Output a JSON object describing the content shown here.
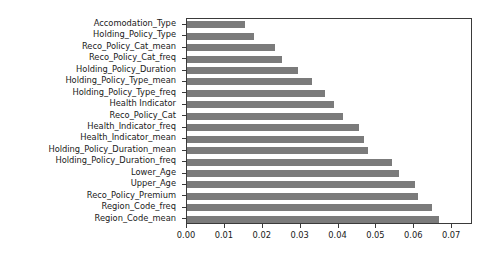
{
  "chart_data": {
    "type": "bar",
    "orientation": "horizontal",
    "title": "",
    "xlabel": "",
    "ylabel": "",
    "xlim": [
      0.0,
      0.0755
    ],
    "grid": false,
    "legend": null,
    "bar_color": "#7b7b7b",
    "frame_color": "#3a3a3a",
    "background": "#ffffff",
    "xticks": [
      0.0,
      0.01,
      0.02,
      0.03,
      0.04,
      0.05,
      0.06,
      0.07
    ],
    "xtick_labels": [
      "0.00",
      "0.01",
      "0.02",
      "0.03",
      "0.04",
      "0.05",
      "0.06",
      "0.07"
    ],
    "categories": [
      "Accomodation_Type",
      "Holding_Policy_Type",
      "Reco_Policy_Cat_mean",
      "Reco_Policy_Cat_freq",
      "Holding_Policy_Duration",
      "Holding_Policy_Type_mean",
      "Holding_Policy_Type_freq",
      "Health Indicator",
      "Reco_Policy_Cat",
      "Health_Indicator_freq",
      "Health_Indicator_mean",
      "Holding_Policy_Duration_mean",
      "Holding_Policy_Duration_freq",
      "Lower_Age",
      "Upper_Age",
      "Reco_Policy_Premium",
      "Region_Code_freq",
      "Region_Code_mean"
    ],
    "values": [
      0.0153,
      0.0178,
      0.0232,
      0.0252,
      0.0294,
      0.0331,
      0.0363,
      0.0388,
      0.0412,
      0.0454,
      0.0467,
      0.0479,
      0.054,
      0.056,
      0.0602,
      0.061,
      0.0647,
      0.0664
    ]
  }
}
